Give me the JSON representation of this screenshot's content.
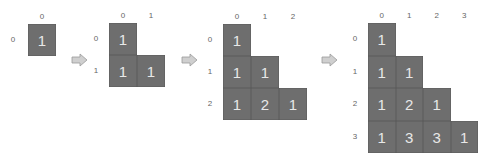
{
  "diagram": {
    "type": "pascal-triangle-progression",
    "panels": [
      {
        "size": 1,
        "cols": [
          "0"
        ],
        "rows": [
          "0"
        ],
        "values": [
          [
            "1"
          ]
        ]
      },
      {
        "size": 2,
        "cols": [
          "0",
          "1"
        ],
        "rows": [
          "0",
          "1"
        ],
        "values": [
          [
            "1"
          ],
          [
            "1",
            "1"
          ]
        ]
      },
      {
        "size": 3,
        "cols": [
          "0",
          "1",
          "2"
        ],
        "rows": [
          "0",
          "1",
          "2"
        ],
        "values": [
          [
            "1"
          ],
          [
            "1",
            "1"
          ],
          [
            "1",
            "2",
            "1"
          ]
        ]
      },
      {
        "size": 4,
        "cols": [
          "0",
          "1",
          "2",
          "3"
        ],
        "rows": [
          "0",
          "1",
          "2",
          "3"
        ],
        "values": [
          [
            "1"
          ],
          [
            "1",
            "1"
          ],
          [
            "1",
            "2",
            "1"
          ],
          [
            "1",
            "3",
            "3",
            "1"
          ]
        ]
      }
    ],
    "arrows": [
      "right-arrow",
      "right-arrow",
      "right-arrow"
    ],
    "colors": {
      "cell": "#6e6e6e",
      "cell_text": "#e8e8e8",
      "label": "#666666",
      "arrow_fill": "#cfcfcf",
      "arrow_stroke": "#9a9a9a"
    }
  }
}
